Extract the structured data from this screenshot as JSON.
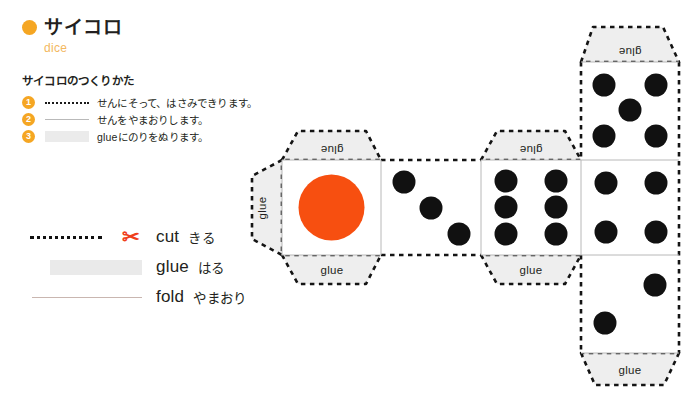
{
  "header": {
    "bullet_color": "#f5a623",
    "title": "サイコロ",
    "subtitle": "dice"
  },
  "instructions": {
    "heading": "サイコロのつくりかた",
    "steps": [
      {
        "number": "1",
        "style": "cut",
        "text": "せんにそって、はさみできります。"
      },
      {
        "number": "2",
        "style": "fold",
        "text": "せんをやまおりします。"
      },
      {
        "number": "3",
        "style": "glue",
        "text": "glueにのりをぬります。"
      }
    ]
  },
  "legend": {
    "rows": [
      {
        "swatch": "cut-dotted-line",
        "icon": "scissors-icon",
        "icon_glyph": "✂",
        "en": "cut",
        "ja": "きる",
        "color": "#ef3f1c"
      },
      {
        "swatch": "glue-gray-block",
        "icon": "",
        "icon_glyph": "",
        "en": "glue",
        "ja": "はる",
        "color": "#eaeaea"
      },
      {
        "swatch": "fold-solid-line",
        "icon": "",
        "icon_glyph": "",
        "en": "fold",
        "ja": "やまおり",
        "color": "#c9b6b0"
      }
    ]
  },
  "net": {
    "glue_tab_label": "glue",
    "glue_tab_fill": "#eeeeee",
    "face_fill": "#ffffff",
    "fold_line_color": "#b8b8b8",
    "cut_line_color": "#141414",
    "pip_color": "#111111",
    "one_pip_color": "#f74f10",
    "faces": [
      {
        "name": "face-1",
        "pips": 1,
        "x": 282,
        "y": 160,
        "w": 99,
        "h": 95
      },
      {
        "name": "face-3",
        "pips": 3,
        "x": 381,
        "y": 160,
        "w": 100,
        "h": 95
      },
      {
        "name": "face-6",
        "pips": 6,
        "x": 481,
        "y": 160,
        "w": 100,
        "h": 95
      },
      {
        "name": "face-5",
        "pips": 5,
        "x": 581,
        "y": 62,
        "w": 98,
        "h": 98
      },
      {
        "name": "face-4",
        "pips": 4,
        "x": 581,
        "y": 160,
        "w": 98,
        "h": 95
      },
      {
        "name": "face-2",
        "pips": 2,
        "x": 581,
        "y": 255,
        "w": 98,
        "h": 98
      }
    ],
    "glue_tabs": [
      {
        "name": "glue-tab-left",
        "side": "left",
        "flipped": true
      },
      {
        "name": "glue-tab-face1-top",
        "side": "top",
        "flipped": true
      },
      {
        "name": "glue-tab-face1-bottom",
        "side": "bottom",
        "flipped": false
      },
      {
        "name": "glue-tab-face6-top",
        "side": "top",
        "flipped": true
      },
      {
        "name": "glue-tab-face6-bottom",
        "side": "bottom",
        "flipped": false
      },
      {
        "name": "glue-tab-face5-top",
        "side": "top",
        "flipped": true
      },
      {
        "name": "glue-tab-face2-bottom",
        "side": "bottom",
        "flipped": false
      }
    ]
  }
}
